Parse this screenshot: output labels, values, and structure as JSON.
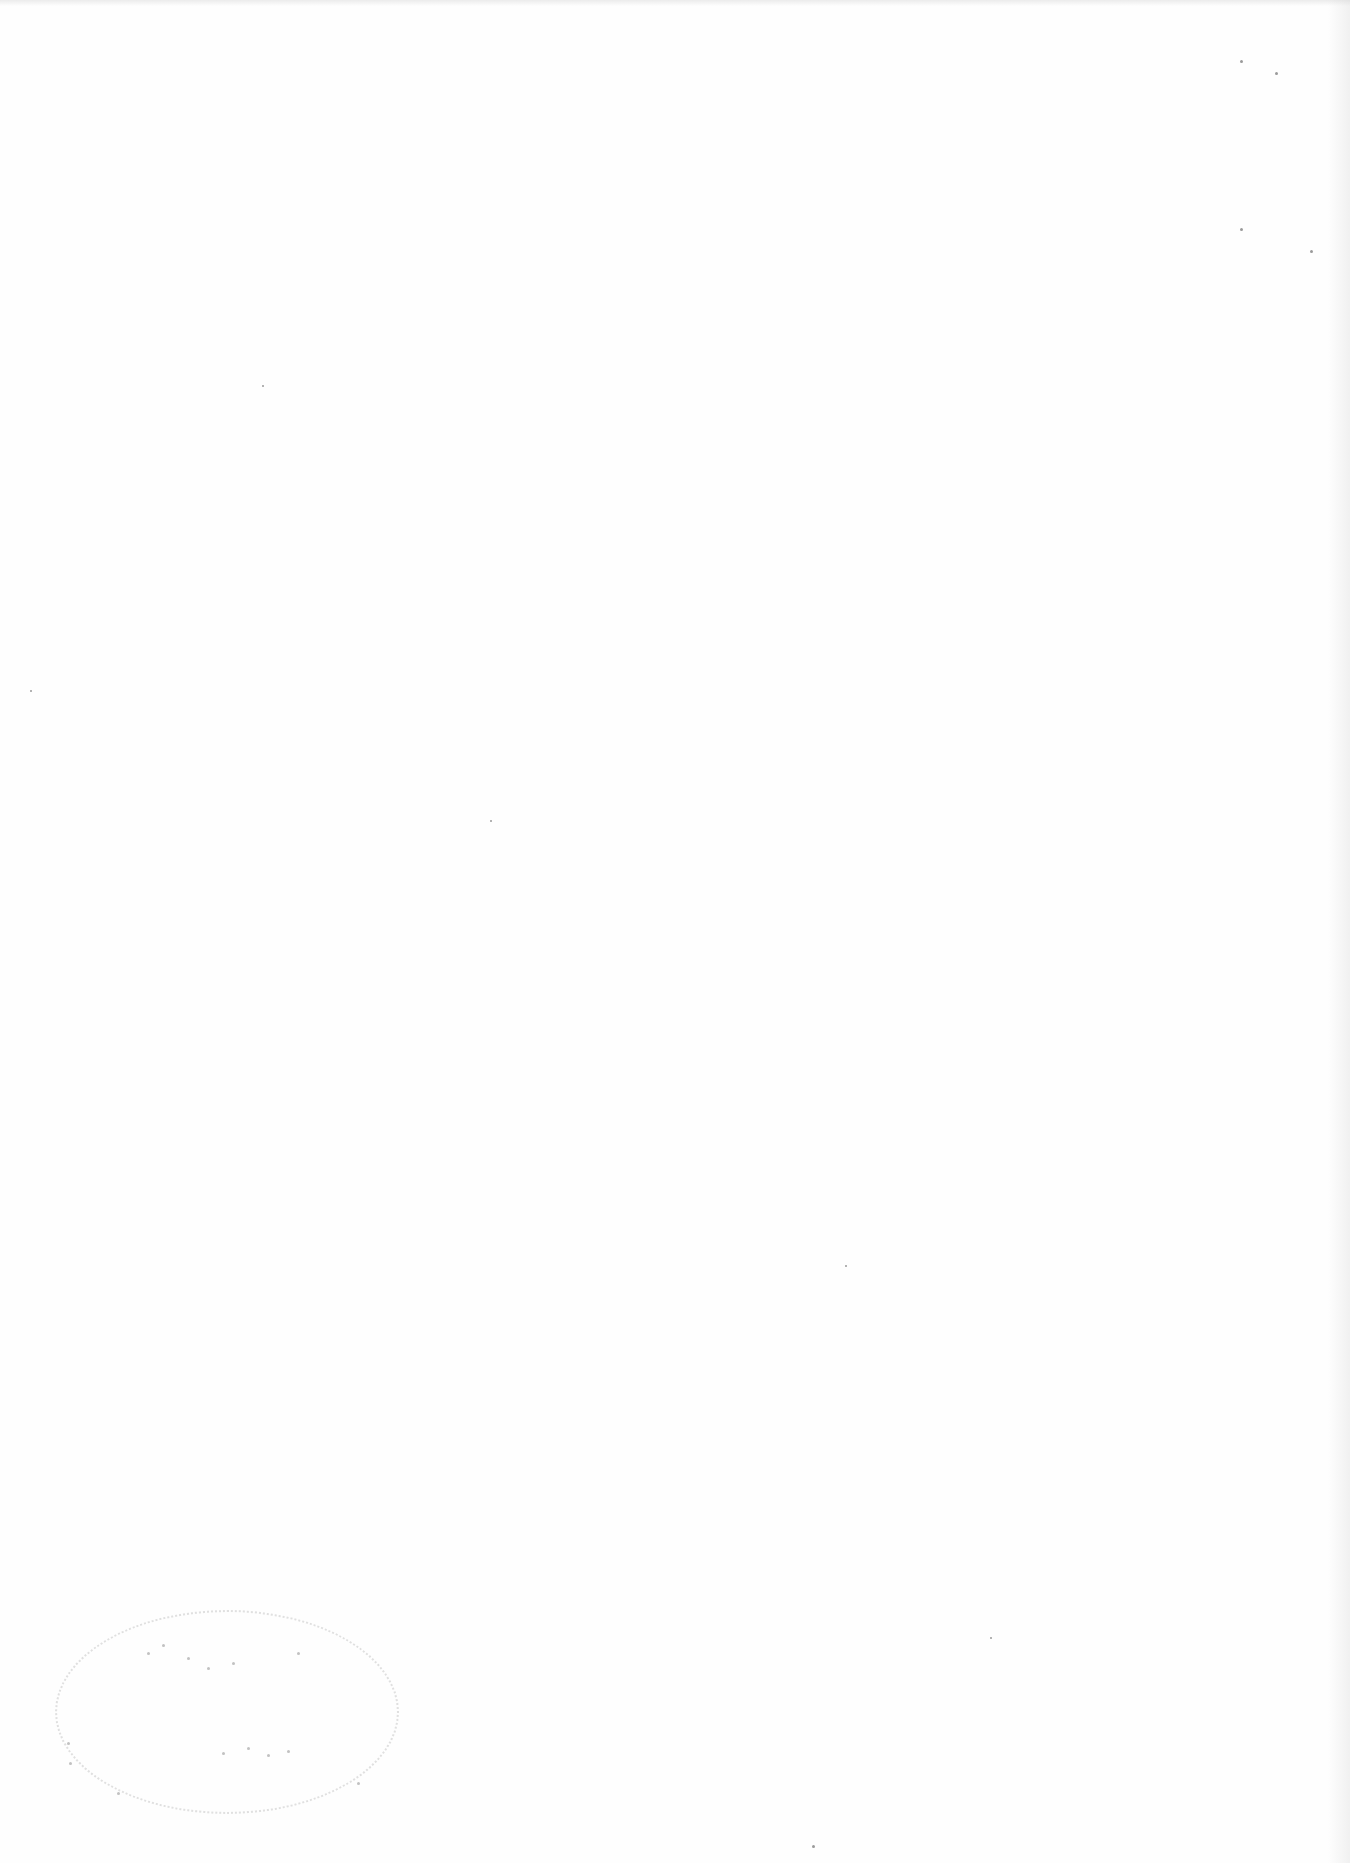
{
  "page": {
    "type": "blank-scanned-page",
    "background": "#fefefe",
    "visible_text": [],
    "stamp": {
      "present": true,
      "legible": false,
      "position": "bottom-left"
    }
  }
}
